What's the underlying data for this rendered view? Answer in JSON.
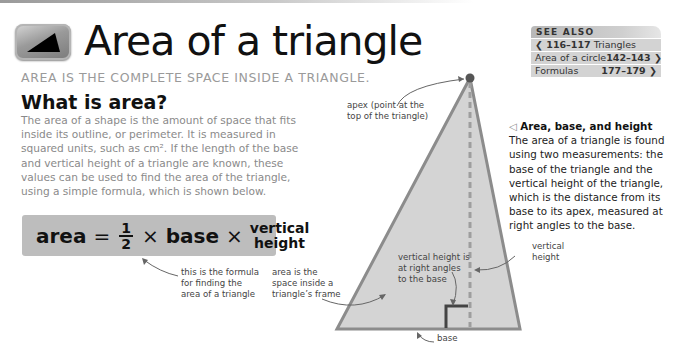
{
  "header": {
    "title": "Area of a triangle",
    "subtitle": "AREA IS THE COMPLETE SPACE INSIDE A TRIANGLE.",
    "icon": "triangle-icon"
  },
  "see_also": {
    "title": "SEE ALSO",
    "items": [
      {
        "pages": "116–117",
        "label": "Triangles",
        "direction": "back",
        "arrow": "❮"
      },
      {
        "pages": "142–143",
        "label": "Area of a circle",
        "direction": "forward",
        "arrow": "❯"
      },
      {
        "pages": "177–179",
        "label": "Formulas",
        "direction": "forward",
        "arrow": "❯"
      }
    ]
  },
  "section": {
    "heading": "What is area?",
    "body": "The area of a shape is the amount of space that fits inside its outline, or perimeter. It is measured in squared units, such as cm². If the length of the base and vertical height of a triangle are known, these values can be used to find the area of the triangle, using a simple formula, which is shown below."
  },
  "formula": {
    "lhs": "area",
    "equals": "=",
    "numerator": "1",
    "denominator": "2",
    "times1": "×",
    "base": "base",
    "times2": "×",
    "height_line1": "vertical",
    "height_line2": "height"
  },
  "annotations": {
    "formula_note": [
      "this is the formula",
      "for finding the",
      "area of a triangle"
    ],
    "area_note": [
      "area is the",
      "space inside a",
      "triangle’s frame"
    ],
    "apex_note": [
      "apex (point at the",
      "top of the triangle)"
    ],
    "right_angle_note": [
      "vertical height is",
      "at right angles",
      "to the base"
    ],
    "vertical_height_note": [
      "vertical",
      "height"
    ],
    "base_note": "base"
  },
  "caption": {
    "glyph": "◁",
    "title": "Area, base, and height",
    "body": "The area of a triangle is found using two measurements: the base of the triangle and the vertical height of the triangle, which is the distance from its base to its apex, measured at right angles to the base."
  },
  "colors": {
    "triangle_fill": "#d4d4d4",
    "triangle_stroke": "#8c8c8c",
    "formula_bg": "#bdbdbd",
    "subtitle": "#9a9a9a",
    "body_text": "#8a8a8a",
    "apex_dot": "#555555"
  }
}
